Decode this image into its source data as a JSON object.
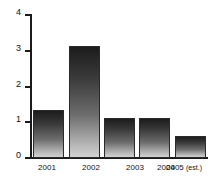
{
  "chart_data": {
    "type": "bar",
    "title": "",
    "subtitle": "",
    "xlabel": "",
    "ylabel": "",
    "categories": [
      "2001",
      "2002",
      "2003",
      "2004",
      "2005 (est.)"
    ],
    "values": [
      1.35,
      3.12,
      1.12,
      1.12,
      0.62
    ],
    "series": [
      {
        "name": "",
        "values": [
          1.35,
          3.12,
          1.12,
          1.12,
          0.62
        ]
      }
    ],
    "ylim": [
      0,
      4
    ],
    "xlim": [
      0,
      5
    ],
    "y_ticks": [
      0,
      1,
      2,
      3,
      4
    ],
    "y_tick_labels": [
      "0",
      "1",
      "2",
      "3",
      "4"
    ],
    "grid": false,
    "legend": false,
    "legend_position": "none",
    "annotations": [],
    "bar_style": {
      "fill": "vertical-gradient",
      "gradient_top": "#1c1c1c",
      "gradient_bottom": "#d2d2d2",
      "outline": "#2a2a2a"
    },
    "axis_color": "#1a1a1a",
    "background": "#ffffff"
  },
  "labels": {
    "cat_0": "2001",
    "cat_1": "2002",
    "cat_2": "2003",
    "cat_3": "2004",
    "cat_4_year": "2005",
    "cat_4_est": "(est.)"
  },
  "y_axis": {
    "t0": "0",
    "t1": "1",
    "t2": "2",
    "t3": "3",
    "t4": "4"
  }
}
